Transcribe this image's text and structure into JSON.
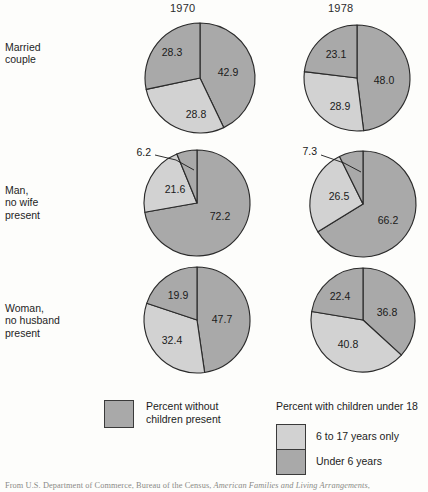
{
  "colors": {
    "dark_gray": "#a9a9a9",
    "light_gray": "#d2d2d2",
    "outline": "#2b2b2b",
    "background": "#fdfdfb",
    "text": "#1c1c1c"
  },
  "columns": [
    {
      "label": "1970",
      "x": 200
    },
    {
      "label": "1978",
      "x": 357
    }
  ],
  "rows": [
    {
      "label": "Married\ncouple",
      "y": 70
    },
    {
      "label": "Man,\nno wife\npresent",
      "y": 184
    },
    {
      "label": "Woman,\nno husband\npresent",
      "y": 302
    }
  ],
  "legend": {
    "left": {
      "swatch_color": "#a9a9a9",
      "text": "Percent without\nchildren present"
    },
    "right": {
      "heading": "Percent with children under 18",
      "items": [
        {
          "swatch_color": "#d2d2d2",
          "text": "6 to 17 years only"
        },
        {
          "swatch_color": "#a9a9a9",
          "text": "Under 6 years"
        }
      ]
    }
  },
  "source": {
    "prefix": "From U.S. Department of Commerce, Bureau of the Census, ",
    "italic": "American Families and Living Arrangements",
    "suffix": ","
  },
  "chart_data": {
    "type": "pie",
    "title": "",
    "legend_position": "bottom",
    "segment_names": [
      "Percent without children present",
      "6 to 17 years only",
      "Under 6 years"
    ],
    "charts": [
      {
        "row": "Married couple",
        "column": "1970",
        "cx": 200,
        "cy": 78,
        "r": 55,
        "slices": [
          {
            "label": "42.9",
            "value": 42.9,
            "shade": "dark",
            "lx": 228,
            "ly": 73
          },
          {
            "label": "28.8",
            "value": 28.8,
            "shade": "light",
            "lx": 196,
            "ly": 115
          },
          {
            "label": "28.3",
            "value": 28.3,
            "shade": "dark",
            "lx": 172,
            "ly": 53
          }
        ]
      },
      {
        "row": "Married couple",
        "column": "1978",
        "cx": 357,
        "cy": 78,
        "r": 53,
        "slices": [
          {
            "label": "48.0",
            "value": 48.0,
            "shade": "dark",
            "lx": 384,
            "ly": 81
          },
          {
            "label": "28.9",
            "value": 28.9,
            "shade": "light",
            "lx": 340,
            "ly": 107
          },
          {
            "label": "23.1",
            "value": 23.1,
            "shade": "dark",
            "lx": 336,
            "ly": 55
          }
        ]
      },
      {
        "row": "Man, no wife present",
        "column": "1970",
        "cx": 197,
        "cy": 203,
        "r": 53,
        "slices": [
          {
            "label": "72.2",
            "value": 72.2,
            "shade": "dark",
            "lx": 220,
            "ly": 217
          },
          {
            "label": "21.6",
            "value": 21.6,
            "shade": "light",
            "lx": 175,
            "ly": 190
          },
          {
            "label": "6.2",
            "value": 6.2,
            "shade": "dark",
            "lx": 151,
            "ly": 153,
            "callout": true,
            "leader": [
              [
                155,
                155
              ],
              [
                176,
                160
              ],
              [
                194,
                170
              ]
            ]
          }
        ]
      },
      {
        "row": "Man, no wife present",
        "column": "1978",
        "cx": 363,
        "cy": 204,
        "r": 53,
        "slices": [
          {
            "label": "66.2",
            "value": 66.2,
            "shade": "dark",
            "lx": 388,
            "ly": 221
          },
          {
            "label": "26.5",
            "value": 26.5,
            "shade": "light",
            "lx": 339,
            "ly": 197
          },
          {
            "label": "7.3",
            "value": 7.3,
            "shade": "dark",
            "lx": 317,
            "ly": 152,
            "callout": true,
            "leader": [
              [
                321,
                155
              ],
              [
                344,
                163
              ],
              [
                361,
                172
              ]
            ]
          }
        ]
      },
      {
        "row": "Woman, no husband present",
        "column": "1970",
        "cx": 197,
        "cy": 320,
        "r": 53,
        "slices": [
          {
            "label": "47.7",
            "value": 47.7,
            "shade": "dark",
            "lx": 222,
            "ly": 320
          },
          {
            "label": "32.4",
            "value": 32.4,
            "shade": "light",
            "lx": 172,
            "ly": 341
          },
          {
            "label": "19.9",
            "value": 19.9,
            "shade": "dark",
            "lx": 178,
            "ly": 296
          }
        ]
      },
      {
        "row": "Woman, no husband present",
        "column": "1978",
        "cx": 363,
        "cy": 320,
        "r": 52,
        "slices": [
          {
            "label": "36.8",
            "value": 36.8,
            "shade": "dark",
            "lx": 387,
            "ly": 313
          },
          {
            "label": "40.8",
            "value": 40.8,
            "shade": "light",
            "lx": 348,
            "ly": 345
          },
          {
            "label": "22.4",
            "value": 22.4,
            "shade": "dark",
            "lx": 340,
            "ly": 297
          }
        ]
      }
    ]
  }
}
